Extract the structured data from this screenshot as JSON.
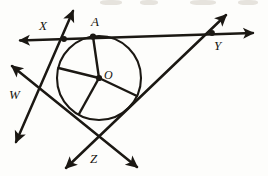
{
  "figure": {
    "domain": "Diagram",
    "background_color": "#fdfdfb",
    "ink_color": "#1b1813",
    "width": 268,
    "height": 176
  },
  "labels": {
    "X": "X",
    "A": "A",
    "Y": "Y",
    "O": "O",
    "W": "W",
    "Z": "Z"
  },
  "geometry": {
    "circle": {
      "name": "inscribed-circle",
      "cx": 99,
      "cy": 78,
      "r": 42,
      "stroke_width": 2.1
    },
    "center_point": {
      "name": "center-O",
      "x": 99,
      "y": 78
    },
    "tangent_points": [
      {
        "name": "tangent-point-A",
        "x": 93,
        "y": 36.5
      },
      {
        "name": "tangent-point-left",
        "x": 58.5,
        "y": 68
      },
      {
        "name": "tangent-point-bottom",
        "x": 79,
        "y": 114
      },
      {
        "name": "tangent-point-right",
        "x": 137,
        "y": 96
      }
    ],
    "vertices": [
      {
        "name": "vertex-X",
        "x": 64,
        "y": 39
      },
      {
        "name": "vertex-Y",
        "x": 212,
        "y": 33
      },
      {
        "name": "vertex-Z",
        "x": 97,
        "y": 148
      },
      {
        "name": "vertex-W",
        "x": 41,
        "y": 97
      }
    ],
    "lines": [
      {
        "name": "line-XY-horizontal",
        "from": {
          "x": 20,
          "y": 40.5
        },
        "to": {
          "x": 253,
          "y": 33
        },
        "arrow_start": true,
        "arrow_end": true,
        "stroke_width": 2.2
      },
      {
        "name": "line-XW-tangent",
        "from": {
          "x": 73,
          "y": 11
        },
        "to": {
          "x": 16,
          "y": 142
        },
        "arrow_start": true,
        "arrow_end": true,
        "stroke_width": 2.4
      },
      {
        "name": "line-WZ-tangent",
        "from": {
          "x": 12,
          "y": 66
        },
        "to": {
          "x": 137,
          "y": 167
        },
        "arrow_start": true,
        "arrow_end": true,
        "stroke_width": 2.4
      },
      {
        "name": "line-ZY-tangent",
        "from": {
          "x": 66,
          "y": 168
        },
        "to": {
          "x": 226,
          "y": 15
        },
        "arrow_start": true,
        "arrow_end": true,
        "stroke_width": 2.4
      }
    ],
    "radii": [
      {
        "name": "radius-OA",
        "to_x": 93,
        "to_y": 36.5
      },
      {
        "name": "radius-O-left",
        "to_x": 58.5,
        "to_y": 68
      },
      {
        "name": "radius-O-bottom",
        "to_x": 79,
        "to_y": 114
      },
      {
        "name": "radius-O-right",
        "to_x": 137,
        "to_y": 96
      }
    ]
  }
}
